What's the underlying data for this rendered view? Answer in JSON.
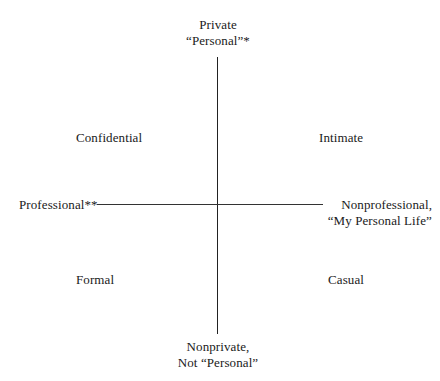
{
  "diagram": {
    "type": "quadrant",
    "axes": {
      "vertical": {
        "top": {
          "line1": "Private",
          "line2": "“Personal”*"
        },
        "bottom": {
          "line1": "Nonprivate,",
          "line2": "Not “Personal”"
        }
      },
      "horizontal": {
        "left": {
          "line1": "Professional**"
        },
        "right": {
          "line1": "Nonprofessional,",
          "line2": "“My Personal Life”"
        }
      }
    },
    "quadrants": {
      "top_left": "Confidential",
      "top_right": "Intimate",
      "bottom_left": "Formal",
      "bottom_right": "Casual"
    },
    "colors": {
      "background": "#ffffff",
      "text": "#1a1a1a",
      "lines": "#222222"
    }
  }
}
